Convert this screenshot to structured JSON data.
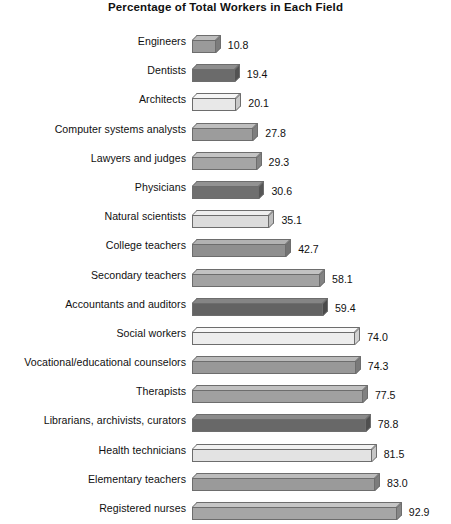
{
  "chart_data": {
    "type": "bar",
    "orientation": "horizontal",
    "title": "Percentage of Total Workers in Each Field",
    "xlabel": "",
    "ylabel": "",
    "xlim": [
      0,
      100
    ],
    "grid": false,
    "legend": "none",
    "value_label_format": "one-decimal",
    "categories": [
      "Engineers",
      "Dentists",
      "Architects",
      "Computer systems analysts",
      "Lawyers and judges",
      "Physicians",
      "Natural scientists",
      "College teachers",
      "Secondary teachers",
      "Accountants and auditors",
      "Social workers",
      "Vocational/educational counselors",
      "Therapists",
      "Librarians, archivists, curators",
      "Health technicians",
      "Elementary teachers",
      "Registered nurses"
    ],
    "values": [
      10.8,
      19.4,
      20.1,
      27.8,
      29.3,
      30.6,
      35.1,
      42.7,
      58.1,
      59.4,
      74.0,
      74.3,
      77.5,
      78.8,
      81.5,
      83.0,
      92.9
    ],
    "value_labels": [
      "10.8",
      "19.4",
      "20.1",
      "27.8",
      "29.3",
      "30.6",
      "35.1",
      "42.7",
      "58.1",
      "59.4",
      "74.0",
      "74.3",
      "77.5",
      "78.8",
      "81.5",
      "83.0",
      "92.9"
    ],
    "bar_colors": [
      "#9a9a9a",
      "#6b6b6b",
      "#e8e8e8",
      "#9c9c9c",
      "#a5a5a5",
      "#6f6f6f",
      "#dcdcdc",
      "#8f8f8f",
      "#a2a2a2",
      "#636363",
      "#ededed",
      "#989898",
      "#a0a0a0",
      "#686868",
      "#e3e3e3",
      "#9a9a9a",
      "#a6a6a6"
    ],
    "bar_top_colors": [
      "#bdbdbd",
      "#8e8e8e",
      "#f6f6f6",
      "#bebebe",
      "#c4c4c4",
      "#929292",
      "#eeeeee",
      "#b2b2b2",
      "#c2c2c2",
      "#858585",
      "#f8f8f8",
      "#bababa",
      "#c0c0c0",
      "#8b8b8b",
      "#f2f2f2",
      "#bcbcbc",
      "#c6c6c6"
    ],
    "bar_side_colors": [
      "#7c7c7c",
      "#525252",
      "#c9c9c9",
      "#7e7e7e",
      "#858585",
      "#565656",
      "#bebebe",
      "#737373",
      "#838383",
      "#4a4a4a",
      "#d2d2d2",
      "#7a7a7a",
      "#818181",
      "#4f4f4f",
      "#c6c6c6",
      "#7c7c7c",
      "#878787"
    ],
    "bar_edge_color": "#6d6d6d",
    "background_color": "#ffffff",
    "text_color": "#101010"
  }
}
